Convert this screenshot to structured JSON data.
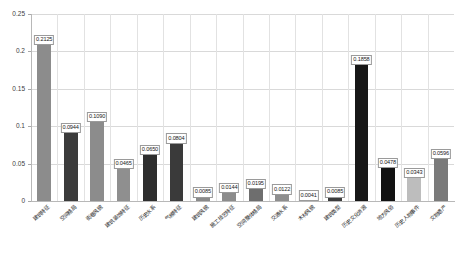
{
  "chart_data": {
    "type": "bar",
    "title": "",
    "xlabel": "",
    "ylabel": "",
    "ylim": [
      0,
      0.25
    ],
    "grid": true,
    "legend": "none",
    "ytick_labels": [
      "0",
      "0.05",
      "0.1",
      "0.15",
      "0.2",
      "0.25"
    ],
    "ytick_values": [
      0,
      0.05,
      0.1,
      0.15,
      0.2,
      0.25
    ],
    "categories": [
      "建筑特征",
      "空间格局",
      "街巷风貌",
      "建筑装饰特征",
      "历史水系",
      "气候特征",
      "建筑风貌",
      "施工技艺特征",
      "空间整体格局",
      "交通水系",
      "木材风貌",
      "建筑类型",
      "历史文化资源",
      "地方风俗",
      "历史人物事件",
      "文物遗产"
    ],
    "values": [
      0.2125,
      0.0944,
      0.109,
      0.0465,
      0.065,
      0.0804,
      0.0085,
      0.0144,
      0.0195,
      0.0122,
      0.0041,
      0.0085,
      0.1858,
      0.0478,
      0.0343,
      0.0596
    ],
    "value_labels": [
      "0.2125",
      "0.0944",
      "0.1090",
      "0.0465",
      "0.0650",
      "0.0804",
      "0.0085",
      "0.0144",
      "0.0195",
      "0.0122",
      "0.0041",
      "0.0085",
      "0.1858",
      "0.0478",
      "0.0343",
      "0.0596"
    ],
    "bar_colors": [
      "#8c8c8c",
      "#3b3b3b",
      "#8c8c8c",
      "#8f8f8f",
      "#2e2e2e",
      "#3a3a3a",
      "#8a8a8a",
      "#8c8c8c",
      "#6e6e6e",
      "#8e8e8e",
      "#909090",
      "#3c3c3c",
      "#171717",
      "#121212",
      "#bdbdbd",
      "#7a7a7a"
    ]
  }
}
